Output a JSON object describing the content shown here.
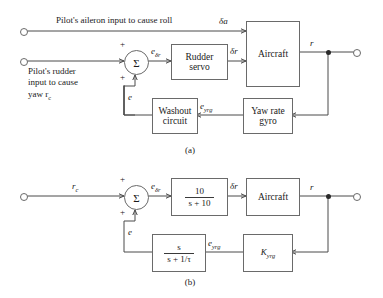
{
  "figure": {
    "type": "control-system-block-diagram",
    "caption_a": "(a)",
    "caption_b": "(b)"
  },
  "diagram_a": {
    "inputs": [
      {
        "id": "aileron",
        "label": "Pilot's aileron input to cause roll",
        "signal": "δa"
      },
      {
        "id": "rudder",
        "line1": "Pilot's rudder",
        "line2": "input to cause",
        "line3": "yaw r",
        "line3_sub": "c"
      }
    ],
    "summing_junction": {
      "symbol": "Σ",
      "sign_top": "+",
      "sign_bottom": "+"
    },
    "blocks": [
      {
        "id": "rudder-servo",
        "line1": "Rudder",
        "line2": "servo"
      },
      {
        "id": "aircraft",
        "label": "Aircraft"
      },
      {
        "id": "washout-circuit",
        "line1": "Washout",
        "line2": "circuit"
      },
      {
        "id": "yaw-rate-gyro",
        "line1": "Yaw rate",
        "line2": "gyro"
      }
    ],
    "signals": {
      "sum_output": "e",
      "sum_output_sub": "δr",
      "servo_output": "δr",
      "aircraft_output": "r",
      "gyro_output": "e",
      "gyro_output_sub": "yrg",
      "washout_output": "e"
    }
  },
  "diagram_b": {
    "input": {
      "label": "r",
      "label_sub": "c"
    },
    "summing_junction": {
      "symbol": "Σ",
      "sign_top": "+",
      "sign_bottom": "+"
    },
    "blocks": [
      {
        "id": "rudder-servo-tf",
        "numerator": "10",
        "denominator": "s + 10"
      },
      {
        "id": "aircraft",
        "label": "Aircraft"
      },
      {
        "id": "washout-tf",
        "numerator": "s",
        "denominator": "s + 1/τ"
      },
      {
        "id": "gyro-gain",
        "label": "K",
        "label_sub": "yrg"
      }
    ],
    "signals": {
      "sum_output": "e",
      "sum_output_sub": "δr",
      "servo_output": "δr",
      "aircraft_output": "r",
      "gyro_output": "e",
      "gyro_output_sub": "yrg",
      "washout_output": "e"
    }
  }
}
